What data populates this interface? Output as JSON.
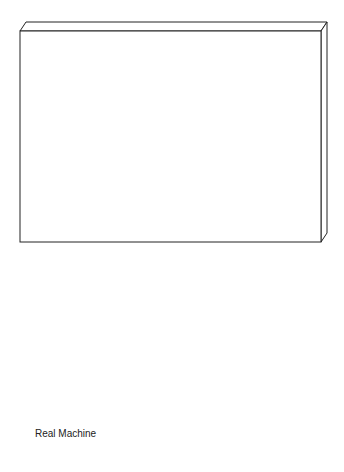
{
  "diagram": {
    "real_machine": {
      "label": "Real Machine"
    },
    "application": {
      "label": "Application",
      "multiplicity": "*"
    },
    "abstract_instruction": {
      "line1": "Abstract",
      "line2": "Instruction"
    },
    "parameter": {
      "label": "Parameter"
    },
    "assoc_param": {
      "source_mult": "1",
      "target_mult": "*"
    },
    "concrete_instruction": {
      "label": "Concrete Instruction",
      "multiplicity": "*"
    },
    "virtual_machine": {
      "label": "Virtual Machine",
      "multiplicity": "1"
    },
    "sequencer": {
      "name": "Sequencer",
      "attribute": "Current Application",
      "operations": [
        "Load",
        "Run",
        "Fetch"
      ]
    },
    "acb": {
      "line1": "Application",
      "line2": "Control Block",
      "multiplicity": "*",
      "attributes": [
        "Current Instruction",
        "Stack Address",
        "Heap Address"
      ]
    },
    "instruction_engine": {
      "line1": "Instruction",
      "line2": "Engine"
    }
  }
}
